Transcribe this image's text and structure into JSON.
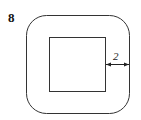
{
  "problem": {
    "number": "8"
  },
  "figure": {
    "outer_shape": "rounded-square",
    "inner_shape": "square",
    "dimension_label": "2",
    "stroke_color": "#333333"
  }
}
